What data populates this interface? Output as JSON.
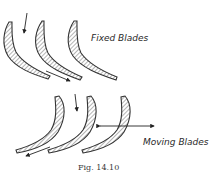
{
  "figure": {
    "caption": "Fig. 14.10",
    "colors": {
      "ink": "#333333",
      "background": "#ffffff"
    },
    "groups": [
      {
        "id": "fixed",
        "label": "Fixed Blades",
        "blade_count": 3,
        "arrows": [
          "flow-in-downward",
          "blade-exit-velocity"
        ]
      },
      {
        "id": "moving",
        "label": "Moving Blades",
        "blade_count": 3,
        "arrows": [
          "flow-in-downward",
          "blade-motion-double-headed",
          "exit-velocity"
        ]
      }
    ]
  }
}
